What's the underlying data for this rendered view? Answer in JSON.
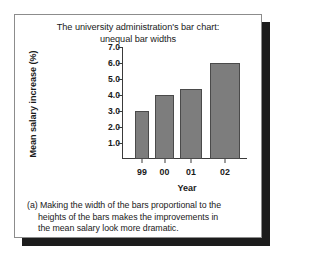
{
  "figure": {
    "title_lines": [
      "The university administration's bar chart:",
      "unequal bar widths"
    ],
    "caption_lines": [
      "(a) Making the width of the bars proportional to the",
      "heights of the bars makes the improvements in",
      "the mean salary look more dramatic."
    ]
  },
  "colors": {
    "bar_fill": "#7d7d7d",
    "bar_stroke": "#4a4a4a",
    "axis": "#3a3a3a",
    "card_border": "#8c8c8c",
    "shadow": "#1c1c1c",
    "background": "#ffffff"
  },
  "chart_data": {
    "type": "bar",
    "title": "The university administration's bar chart: unequal bar widths",
    "xlabel": "Year",
    "ylabel": "Mean salary increase (%)",
    "categories": [
      "99",
      "00",
      "01",
      "02"
    ],
    "values": [
      3.0,
      4.0,
      4.4,
      6.0
    ],
    "bar_widths": [
      14,
      19,
      22,
      30
    ],
    "bar_left_positions": [
      13,
      33,
      58,
      88
    ],
    "ylim": [
      0,
      7.0
    ],
    "yticks": [
      "1.0",
      "2.0",
      "3.0",
      "4.0",
      "5.0",
      "6.0",
      "7.0"
    ],
    "ytick_values": [
      1.0,
      2.0,
      3.0,
      4.0,
      5.0,
      6.0,
      7.0
    ],
    "grid": false,
    "legend": null,
    "note": "Bar widths are drawn proportional to bar heights (unequal widths)."
  }
}
